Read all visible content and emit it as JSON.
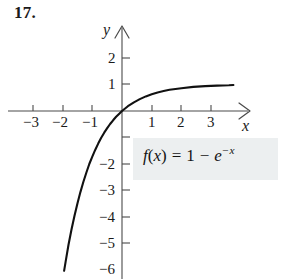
{
  "exercise": {
    "number": "17."
  },
  "equation": {
    "lhs": "f",
    "open_paren": "(",
    "arg": "x",
    "close_paren": ")",
    "equals": "=",
    "one": "1",
    "minus": "−",
    "base": "e",
    "exponent": "−x",
    "plain_text": "f(x) = 1 − e^(−x)",
    "background_color": "#eceff0"
  },
  "axes": {
    "x_label": "x",
    "y_label": "y",
    "x_ticks": [
      "−3",
      "−2",
      "−1",
      "1",
      "2",
      "3"
    ],
    "y_ticks": [
      "2",
      "1",
      "−2",
      "−3",
      "−4",
      "−5",
      "−6"
    ],
    "axis_color": "#4a4a4a",
    "curve_color": "#111111"
  },
  "chart_data": {
    "type": "line",
    "title": "",
    "xlabel": "x",
    "ylabel": "y",
    "xlim": [
      -3.9,
      4.3
    ],
    "ylim": [
      -6.8,
      2.5
    ],
    "xticks": [
      -3,
      -2,
      -1,
      1,
      2,
      3
    ],
    "yticks": [
      2,
      1,
      -2,
      -3,
      -4,
      -5,
      -6
    ],
    "grid": false,
    "legend": null,
    "annotations": [
      {
        "text": "f(x) = 1 − e^(−x)",
        "x": 1.4,
        "y": -2.6
      }
    ],
    "series": [
      {
        "name": "f(x) = 1 - e^(-x)",
        "x": [
          -1.95,
          -1.9,
          -1.8,
          -1.7,
          -1.6,
          -1.5,
          -1.4,
          -1.3,
          -1.2,
          -1.1,
          -1.0,
          -0.9,
          -0.8,
          -0.7,
          -0.6,
          -0.5,
          -0.4,
          -0.3,
          -0.2,
          -0.1,
          0.0,
          0.2,
          0.4,
          0.6,
          0.8,
          1.0,
          1.2,
          1.4,
          1.6,
          1.8,
          2.0,
          2.4,
          2.8,
          3.2,
          3.6,
          3.75
        ],
        "y": [
          -6.03,
          -5.69,
          -5.05,
          -4.47,
          -3.95,
          -3.48,
          -3.06,
          -2.67,
          -2.32,
          -2.0,
          -1.72,
          -1.46,
          -1.23,
          -1.01,
          -0.82,
          -0.65,
          -0.49,
          -0.35,
          -0.22,
          -0.11,
          0.0,
          0.18,
          0.33,
          0.45,
          0.55,
          0.63,
          0.7,
          0.75,
          0.8,
          0.83,
          0.86,
          0.91,
          0.94,
          0.96,
          0.97,
          0.98
        ]
      }
    ]
  }
}
